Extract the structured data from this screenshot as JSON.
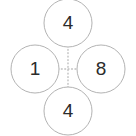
{
  "diagram": {
    "type": "node-cross",
    "canvas": {
      "width": 136,
      "height": 136,
      "background": "#ffffff"
    },
    "style": {
      "circle_stroke_color": "#b3b3b3",
      "circle_stroke_width": 1,
      "circle_fill": "#ffffff",
      "circle_radius": 24,
      "label_color": "#2b2b2b",
      "connector_color": "#bfbfbf",
      "connector_style": "dotted",
      "connector_width": 1.4
    },
    "center": {
      "x": 68,
      "y": 69
    },
    "nodes": [
      {
        "id": "top",
        "position": "top",
        "label": "4",
        "cx": 68,
        "cy": 23
      },
      {
        "id": "left",
        "position": "left",
        "label": "1",
        "cx": 35,
        "cy": 69
      },
      {
        "id": "right",
        "position": "right",
        "label": "8",
        "cx": 101,
        "cy": 69
      },
      {
        "id": "bottom",
        "position": "bottom",
        "label": "4",
        "cx": 68,
        "cy": 111
      }
    ],
    "connectors": [
      {
        "id": "vertical",
        "orientation": "vertical",
        "x1": 68,
        "y1": 46,
        "x2": 68,
        "y2": 92
      },
      {
        "id": "horizontal",
        "orientation": "horizontal",
        "x1": 58,
        "y1": 69,
        "x2": 78,
        "y2": 69
      },
      {
        "id": "horizontal-left",
        "orientation": "horizontal",
        "x1": 58,
        "y1": 69,
        "x2": 78,
        "y2": 69
      }
    ],
    "connector_span": {
      "vertical": {
        "x": 68,
        "y_start": 46,
        "y_end": 92
      },
      "horizontal": {
        "y": 69,
        "x_start": 58,
        "x_end": 78
      }
    }
  }
}
